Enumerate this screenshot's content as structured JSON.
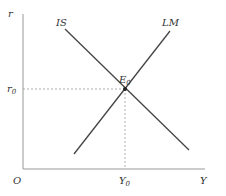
{
  "diagram": {
    "axes": {
      "y_label": "r",
      "x_label": "Y",
      "origin_label": "O"
    },
    "curves": [
      {
        "name": "IS",
        "label": "IS",
        "slope": "downward"
      },
      {
        "name": "LM",
        "label": "LM",
        "slope": "upward"
      }
    ],
    "equilibrium": {
      "label": "E",
      "label_sub": "0",
      "r_label": "r",
      "r_sub": "0",
      "y_label": "Y",
      "y_sub": "0"
    },
    "colors": {
      "line": "#444444",
      "axis": "#888888",
      "dashed": "#999999",
      "text": "#333333"
    }
  }
}
